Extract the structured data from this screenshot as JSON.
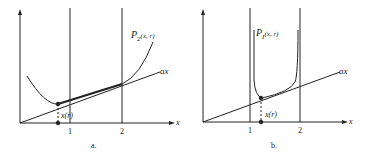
{
  "figure": {
    "panels": [
      {
        "id": "a",
        "caption": "a.",
        "curve_label": "P",
        "curve_label_sub": "2",
        "curve_label_args": "(x, r)",
        "line_label": "ax",
        "x_axis_label": "x",
        "point_label": "x(r)",
        "ticks": [
          "1",
          "2"
        ]
      },
      {
        "id": "b",
        "caption": "b.",
        "curve_label": "P",
        "curve_label_sub": "I",
        "curve_label_args": "(x, r)",
        "line_label": "ax",
        "x_axis_label": "x",
        "point_label": "x(r)",
        "ticks": [
          "1",
          "2"
        ]
      }
    ]
  }
}
